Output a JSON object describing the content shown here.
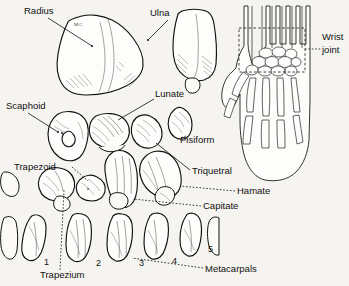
{
  "figure": {
    "background_color": "#f5f4f0",
    "ink_color": "#111111"
  },
  "labels": {
    "radius": "Radius",
    "ulna": "Ulna",
    "scaphoid": "Scaphoid",
    "lunate": "Lunate",
    "pisiform": "Pisiform",
    "triquetral": "Triquetral",
    "hamate": "Hamate",
    "capitate": "Capitate",
    "trapezoid": "Trapezoid",
    "trapezium": "Trapezium",
    "metacarpals": "Metacarpals",
    "wrist_joint_line1": "Wrist",
    "wrist_joint_line2": "joint",
    "radius_margin_note": "M.C"
  },
  "metacarpal_numbers": [
    "1",
    "2",
    "3",
    "4",
    "5"
  ],
  "inset": {
    "name": "hand-outline-diagram",
    "callout": "Wrist joint",
    "region_marked": "dashed rectangle over carpal region"
  }
}
